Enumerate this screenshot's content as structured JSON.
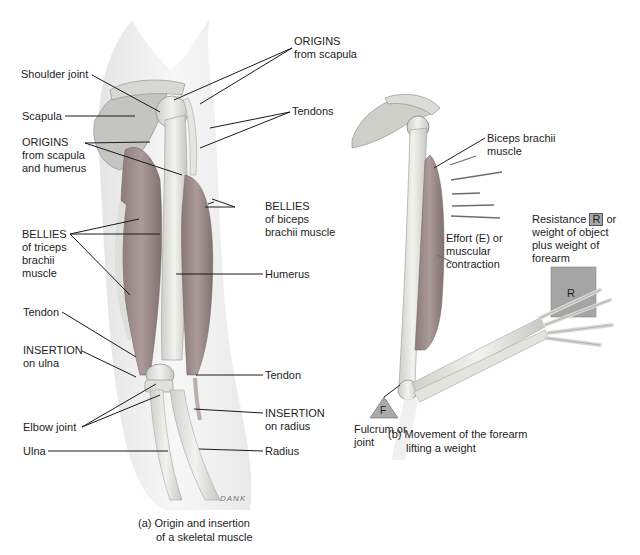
{
  "figure_a": {
    "labels": {
      "origins_scapula": [
        "ORIGINS",
        "from scapula"
      ],
      "shoulder_joint": "Shoulder joint",
      "tendons": "Tendons",
      "scapula": "Scapula",
      "origins_scapula_humerus": [
        "ORIGINS",
        "from scapula",
        "and humerus"
      ],
      "bellies_biceps": [
        "BELLIES",
        "of biceps",
        "brachii muscle"
      ],
      "bellies_triceps": [
        "BELLIES",
        "of triceps",
        "brachii",
        "muscle"
      ],
      "humerus": "Humerus",
      "tendon_upper": "Tendon",
      "insertion_ulna": [
        "INSERTION",
        "on ulna"
      ],
      "tendon_lower": "Tendon",
      "elbow_joint": "Elbow joint",
      "insertion_radius": [
        "INSERTION",
        "on radius"
      ],
      "ulna": "Ulna",
      "radius": "Radius"
    },
    "signature": "DANK",
    "caption": [
      "(a)",
      "Origin and insertion",
      "of a skeletal muscle"
    ]
  },
  "figure_b": {
    "labels": {
      "biceps": [
        "Biceps brachii",
        "muscle"
      ],
      "resistance": [
        "Resistance",
        "R",
        "or",
        "weight of object",
        "plus weight of",
        "forearm"
      ],
      "effort": [
        "Effort (E) or",
        "muscular",
        "contraction"
      ],
      "fulcrum": [
        "Fulcrum or",
        "joint"
      ],
      "fulcrum_symbol": "F",
      "weight_symbol": "R"
    },
    "caption": [
      "(b)",
      "Movement of the forearm",
      "lifting a weight"
    ]
  },
  "colors": {
    "muscle": "#9b8a88",
    "bone": "#e2e2de",
    "skin": "#e9e9e9",
    "line": "#1a1a1a",
    "weight_box": "#a5a5a5"
  }
}
